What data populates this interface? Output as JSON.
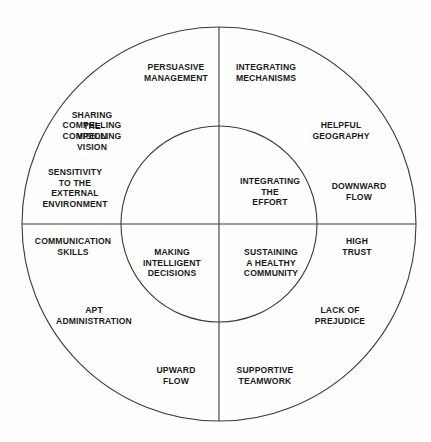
{
  "diagram": {
    "type": "concentric-circle-quadrant-diagram",
    "title": "",
    "colors": {
      "background": "#fefefe",
      "stroke": "#3a3a3a",
      "text": "#1a1a1a"
    },
    "geometry": {
      "center_x": 219,
      "center_y": 224,
      "outer_radius": 197,
      "inner_radius": 98,
      "stroke_width": 1.1
    },
    "inner_quadrants": [
      {
        "id": "inner-top-left",
        "label": "SHARING\nTHE\nCOMPELLING\nVISION",
        "x": 171,
        "y": 188
      },
      {
        "id": "inner-top-right",
        "label": "INTEGRATING\nTHE\nEFFORT",
        "x": 270,
        "y": 192
      },
      {
        "id": "inner-bottom-left",
        "label": "MAKING\nINTELLIGENT\nDECISIONS",
        "x": 172,
        "y": 263
      },
      {
        "id": "inner-bottom-right",
        "label": "SUSTAINING\nA HEALTHY\nCOMMUNITY",
        "x": 271,
        "y": 263
      }
    ],
    "outer_ring_labels": [
      {
        "id": "persuasive-management",
        "label": "PERSUASIVE\nMANAGEMENT",
        "x": 176,
        "y": 73,
        "quadrant": "top-left"
      },
      {
        "id": "integrating-mechanisms",
        "label": "INTEGRATING\nMECHANISMS",
        "x": 266,
        "y": 73,
        "quadrant": "top-right"
      },
      {
        "id": "compelling-vision",
        "label": "COMPELLING\nVISION",
        "x": 92,
        "y": 131,
        "quadrant": "top-left"
      },
      {
        "id": "helpful-geography",
        "label": "HELPFUL\nGEOGRAPHY",
        "x": 341,
        "y": 131,
        "quadrant": "top-right"
      },
      {
        "id": "sensitivity-external-environment",
        "label": "SENSITIVITY\nTO THE\nEXTERNAL\nENVIRONMENT",
        "x": 75,
        "y": 188,
        "quadrant": "left"
      },
      {
        "id": "downward-flow",
        "label": "DOWNWARD\nFLOW",
        "x": 359,
        "y": 192,
        "quadrant": "right"
      },
      {
        "id": "communication-skills",
        "label": "COMMUNICATION\nSKILLS",
        "x": 73,
        "y": 247,
        "quadrant": "bottom-left"
      },
      {
        "id": "high-trust",
        "label": "HIGH\nTRUST",
        "x": 357,
        "y": 247,
        "quadrant": "bottom-right"
      },
      {
        "id": "apt-administration",
        "label": "APT\nADMINISTRATION",
        "x": 94,
        "y": 316,
        "quadrant": "bottom-left"
      },
      {
        "id": "lack-of-prejudice",
        "label": "LACK OF\nPREJUDICE",
        "x": 340,
        "y": 316,
        "quadrant": "bottom-right"
      },
      {
        "id": "upward-flow",
        "label": "UPWARD\nFLOW",
        "x": 176,
        "y": 376,
        "quadrant": "bottom-left"
      },
      {
        "id": "supportive-teamwork",
        "label": "SUPPORTIVE\nTEAMWORK",
        "x": 265,
        "y": 376,
        "quadrant": "bottom-right"
      }
    ]
  }
}
